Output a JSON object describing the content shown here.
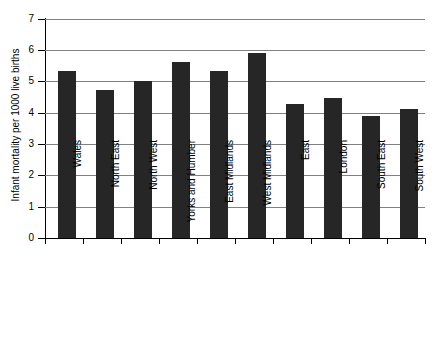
{
  "chart_data": {
    "type": "bar",
    "title": "",
    "subtitle": "",
    "xlabel": "",
    "ylabel": "Infant mortality per 1000 live births",
    "categories": [
      "Wales",
      "North East",
      "North West",
      "Yorks and Humber",
      "East Midlands",
      "West Midlands",
      "East",
      "London",
      "South East",
      "South West"
    ],
    "values": [
      5.3,
      4.7,
      5.0,
      5.6,
      5.3,
      5.9,
      4.25,
      4.45,
      3.88,
      4.12
    ],
    "ylim": [
      0,
      7
    ],
    "ytick_labels": [
      "7",
      "6",
      "5",
      "4",
      "3",
      "2",
      "1",
      "0"
    ],
    "ytick_values": [
      7,
      6,
      5,
      4,
      3,
      2,
      1,
      0
    ],
    "grid": "horizontal",
    "legend": "none",
    "bar_color": "#262626",
    "grid_color": "#808080",
    "axis_color": "#000000",
    "background_color": "#ffffff"
  }
}
